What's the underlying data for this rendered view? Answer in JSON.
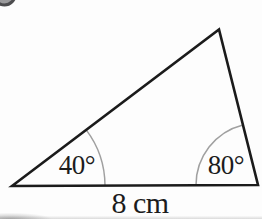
{
  "figure": {
    "type": "triangle-angle-diagram",
    "angle_left_label": "40°",
    "angle_right_label": "80°",
    "base_label": "8 cm"
  },
  "triangle": {
    "angle_left_deg": 40,
    "angle_right_deg": 80,
    "base_length_value": 8,
    "base_length_unit": "cm"
  },
  "badge": {
    "name": "question-number-badge",
    "visible_part": "bottom sliver of a dark circular badge cropped at the top-left corner"
  },
  "colors": {
    "triangle_stroke": "#1b1b1b",
    "angle_arc_stroke": "#a0a0a0",
    "label_text": "#1c1c1c",
    "background": "#fdfdfd",
    "badge_rim": "#4d4d4f",
    "badge_fill": "#9a9a9c"
  }
}
